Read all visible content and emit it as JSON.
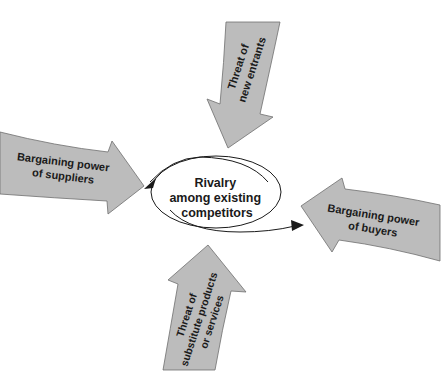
{
  "diagram": {
    "center": {
      "lines": [
        "Rivalry",
        "among existing",
        "competitors"
      ]
    },
    "forces": {
      "top": {
        "lines": [
          "Threat of",
          "new entrants"
        ],
        "direction": "down"
      },
      "left": {
        "lines": [
          "Bargaining power",
          "of suppliers"
        ],
        "direction": "right"
      },
      "right": {
        "lines": [
          "Bargaining power",
          "of buyers"
        ],
        "direction": "left"
      },
      "bottom": {
        "lines": [
          "Threat of",
          "substitute products",
          "or services"
        ],
        "direction": "up"
      }
    },
    "colors": {
      "arrow_fill": "#bcbcbc",
      "arrow_stroke": "#6e6e6e",
      "text": "#1a1a1a",
      "background": "#ffffff"
    }
  }
}
